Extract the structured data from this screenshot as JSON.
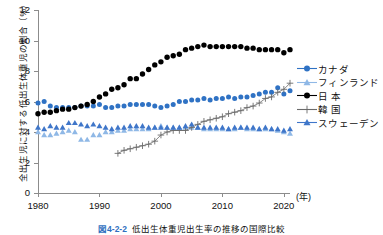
{
  "chart_data": {
    "type": "line",
    "title": "",
    "xlabel": "(年)",
    "ylabel": "全出生児に対する低出生体重児の割合（%）",
    "xlim": [
      1980,
      2021
    ],
    "ylim": [
      0,
      12
    ],
    "ytick_labels": [
      "0",
      "2",
      "4",
      "6",
      "8",
      "10",
      "12"
    ],
    "ytick_values": [
      0,
      2,
      4,
      6,
      8,
      10,
      12
    ],
    "xtick_labels": [
      "1980",
      "1990",
      "2000",
      "2010",
      "2020"
    ],
    "xtick_values": [
      1980,
      1990,
      2000,
      2010,
      2020
    ],
    "grid": false,
    "legend_position": "right",
    "x": [
      1980,
      1981,
      1982,
      1983,
      1984,
      1985,
      1986,
      1987,
      1988,
      1989,
      1990,
      1991,
      1992,
      1993,
      1994,
      1995,
      1996,
      1997,
      1998,
      1999,
      2000,
      2001,
      2002,
      2003,
      2004,
      2005,
      2006,
      2007,
      2008,
      2009,
      2010,
      2011,
      2012,
      2013,
      2014,
      2015,
      2016,
      2017,
      2018,
      2019,
      2020,
      2021
    ],
    "series": [
      {
        "name": "カナダ",
        "color": "#2f72c4",
        "marker": "circle",
        "values": [
          5.9,
          6.0,
          5.7,
          5.6,
          5.6,
          5.6,
          5.6,
          5.7,
          5.7,
          5.7,
          5.8,
          5.6,
          5.6,
          5.7,
          5.7,
          5.8,
          5.8,
          5.8,
          5.8,
          5.7,
          5.6,
          5.7,
          5.8,
          6.0,
          6.0,
          6.1,
          6.1,
          6.2,
          6.1,
          6.2,
          6.2,
          6.3,
          6.2,
          6.3,
          6.3,
          6.4,
          6.5,
          6.6,
          6.6,
          6.9,
          6.5,
          6.7
        ]
      },
      {
        "name": "フィンランド",
        "color": "#8fb8e6",
        "marker": "triangle",
        "values": [
          4.0,
          3.8,
          3.8,
          3.9,
          4.0,
          4.1,
          4.0,
          3.5,
          3.5,
          3.8,
          3.8,
          4.0,
          4.0,
          4.1,
          4.1,
          4.2,
          4.2,
          4.2,
          4.2,
          4.3,
          4.4,
          4.3,
          4.3,
          4.3,
          4.3,
          4.3,
          4.3,
          4.2,
          4.2,
          4.2,
          4.2,
          4.2,
          4.2,
          4.3,
          4.2,
          4.2,
          4.2,
          4.2,
          4.2,
          4.1,
          4.0,
          3.9
        ]
      },
      {
        "name": "日 本",
        "color": "#000000",
        "marker": "circle",
        "values": [
          5.2,
          5.3,
          5.3,
          5.4,
          5.5,
          5.5,
          5.6,
          5.7,
          5.8,
          6.0,
          6.3,
          6.5,
          6.8,
          6.9,
          7.1,
          7.5,
          7.5,
          7.8,
          8.1,
          8.4,
          8.6,
          8.9,
          9.0,
          9.1,
          9.4,
          9.5,
          9.6,
          9.7,
          9.6,
          9.6,
          9.6,
          9.6,
          9.6,
          9.6,
          9.5,
          9.5,
          9.4,
          9.4,
          9.4,
          9.4,
          9.2,
          9.4
        ]
      },
      {
        "name": "韓 国",
        "color": "#6b6b6b",
        "marker": "plus",
        "values": [
          null,
          null,
          null,
          null,
          null,
          null,
          null,
          null,
          null,
          null,
          null,
          null,
          null,
          2.6,
          2.8,
          2.9,
          3.0,
          3.1,
          3.2,
          3.4,
          3.8,
          4.0,
          4.1,
          4.1,
          4.1,
          4.3,
          4.5,
          4.7,
          4.8,
          4.9,
          5.0,
          5.2,
          5.3,
          5.4,
          5.6,
          5.7,
          5.9,
          6.2,
          6.3,
          6.6,
          6.8,
          7.2
        ]
      },
      {
        "name": "スウェーデン",
        "color": "#3f76c9",
        "marker": "triangle",
        "values": [
          4.3,
          4.2,
          4.4,
          4.3,
          4.3,
          4.6,
          4.6,
          4.5,
          4.4,
          4.5,
          4.4,
          4.3,
          4.2,
          4.3,
          4.3,
          4.4,
          4.4,
          4.4,
          4.3,
          4.3,
          4.3,
          4.3,
          4.3,
          4.3,
          4.4,
          4.5,
          4.3,
          4.3,
          4.3,
          4.3,
          4.3,
          4.2,
          4.3,
          4.3,
          4.3,
          4.3,
          4.2,
          4.3,
          4.2,
          4.2,
          4.1,
          4.2
        ]
      }
    ]
  },
  "legend": {
    "items": [
      {
        "label": "カナダ",
        "color": "#2f72c4",
        "marker": "circle"
      },
      {
        "label": "フィンランド",
        "color": "#8fb8e6",
        "marker": "triangle"
      },
      {
        "label": "日 本",
        "color": "#000000",
        "marker": "circle"
      },
      {
        "label": "韓 国",
        "color": "#6b6b6b",
        "marker": "plus"
      },
      {
        "label": "スウェーデン",
        "color": "#3f76c9",
        "marker": "triangle"
      }
    ]
  },
  "caption": {
    "number": "図4-2-2",
    "text": "低出生体重児出生率の推移の国際比較"
  }
}
